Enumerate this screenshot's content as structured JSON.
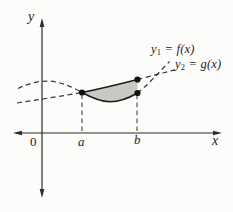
{
  "axes": {
    "y_label": "y",
    "x_label": "x",
    "origin_label": "0",
    "a_tick_label": "a",
    "b_tick_label": "b"
  },
  "curves": {
    "f": {
      "prefix": "y",
      "sub": "1",
      "suffix": " = f(x)"
    },
    "g": {
      "prefix": "y",
      "sub": "2",
      "suffix": " = g(x)"
    }
  },
  "colors": {
    "background": "#fcfcfa",
    "axis": "#2b2b2b",
    "curve": "#1c1c1c",
    "dashed": "#3a3a3a",
    "guide": "#444444",
    "shade": "#c7c9c5",
    "point": "#111111"
  }
}
